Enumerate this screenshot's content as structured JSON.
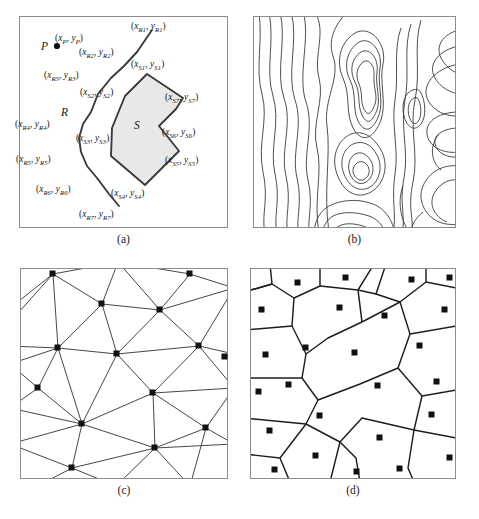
{
  "figure": {
    "panels": [
      {
        "id": "a",
        "caption": "(a)",
        "kind": "geometry-primitives",
        "region_labels": {
          "point": "P",
          "line": "R",
          "area": "S"
        },
        "coordinate_labels": [
          {
            "name": "P",
            "text": "(xP, yP)",
            "var": "x",
            "sub": "P",
            "var2": "y",
            "sub2": "P",
            "x": 36,
            "y": 17
          },
          {
            "name": "R1",
            "text": "(xR1, yR1)",
            "var": "x",
            "sub": "R1",
            "var2": "y",
            "sub2": "R1",
            "x": 112,
            "y": 5
          },
          {
            "name": "R2",
            "text": "(xR2, yR2)",
            "var": "x",
            "sub": "R2",
            "var2": "y",
            "sub2": "R2",
            "x": 60,
            "y": 31
          },
          {
            "name": "R3",
            "text": "(xR3, yR3)",
            "var": "x",
            "sub": "R3",
            "var2": "y",
            "sub2": "R3",
            "x": 25,
            "y": 54
          },
          {
            "name": "R4",
            "text": "(xR4, yR4)",
            "var": "x",
            "sub": "R4",
            "var2": "y",
            "sub2": "R4",
            "x": -4,
            "y": 103
          },
          {
            "name": "R5",
            "text": "(xR5, yR5)",
            "var": "x",
            "sub": "R5",
            "var2": "y",
            "sub2": "R5",
            "x": -3,
            "y": 138
          },
          {
            "name": "R6",
            "text": "(xR6, yR6)",
            "var": "x",
            "sub": "R6",
            "var2": "y",
            "sub2": "R6",
            "x": 17,
            "y": 168
          },
          {
            "name": "R7",
            "text": "(xR7, yR7)",
            "var": "x",
            "sub": "R7",
            "var2": "y",
            "sub2": "R7",
            "x": 60,
            "y": 193
          },
          {
            "name": "S1",
            "text": "(xS1, yS1)",
            "var": "x",
            "sub": "S1",
            "var2": "y",
            "sub2": "S1",
            "x": 112,
            "y": 43
          },
          {
            "name": "S2",
            "text": "(xS2, yS2)",
            "var": "x",
            "sub": "S2",
            "var2": "y",
            "sub2": "S2",
            "x": 61,
            "y": 71
          },
          {
            "name": "S3",
            "text": "(xS3, yS3)",
            "var": "x",
            "sub": "S3",
            "var2": "y",
            "sub2": "S3",
            "x": 57,
            "y": 117
          },
          {
            "name": "S4",
            "text": "(xS4, yS4)",
            "var": "x",
            "sub": "S4",
            "var2": "y",
            "sub2": "S4",
            "x": 92,
            "y": 172
          },
          {
            "name": "S5",
            "text": "(xS5, yS5)",
            "var": "x",
            "sub": "S5",
            "var2": "y",
            "sub2": "S5",
            "x": 146,
            "y": 139
          },
          {
            "name": "S6",
            "text": "(xS6, yS6)",
            "var": "x",
            "sub": "S6",
            "var2": "y",
            "sub2": "S6",
            "x": 143,
            "y": 111
          },
          {
            "name": "S7",
            "text": "(xS7, yS7)",
            "var": "x",
            "sub": "S7",
            "var2": "y",
            "sub2": "S7",
            "x": 146,
            "y": 76
          }
        ]
      },
      {
        "id": "b",
        "caption": "(b)",
        "kind": "contour-lines"
      },
      {
        "id": "c",
        "caption": "(c)",
        "kind": "delaunay-triangulation"
      },
      {
        "id": "d",
        "caption": "(d)",
        "kind": "voronoi-diagram"
      }
    ],
    "colors": {
      "frame": "#8d8d8d",
      "ink": "#151515",
      "polygon_fill": "#e8e8e8",
      "polygon_stroke": "#3a3a3a",
      "contour_stroke": "#2f2f2f",
      "background": "#ffffff"
    }
  }
}
